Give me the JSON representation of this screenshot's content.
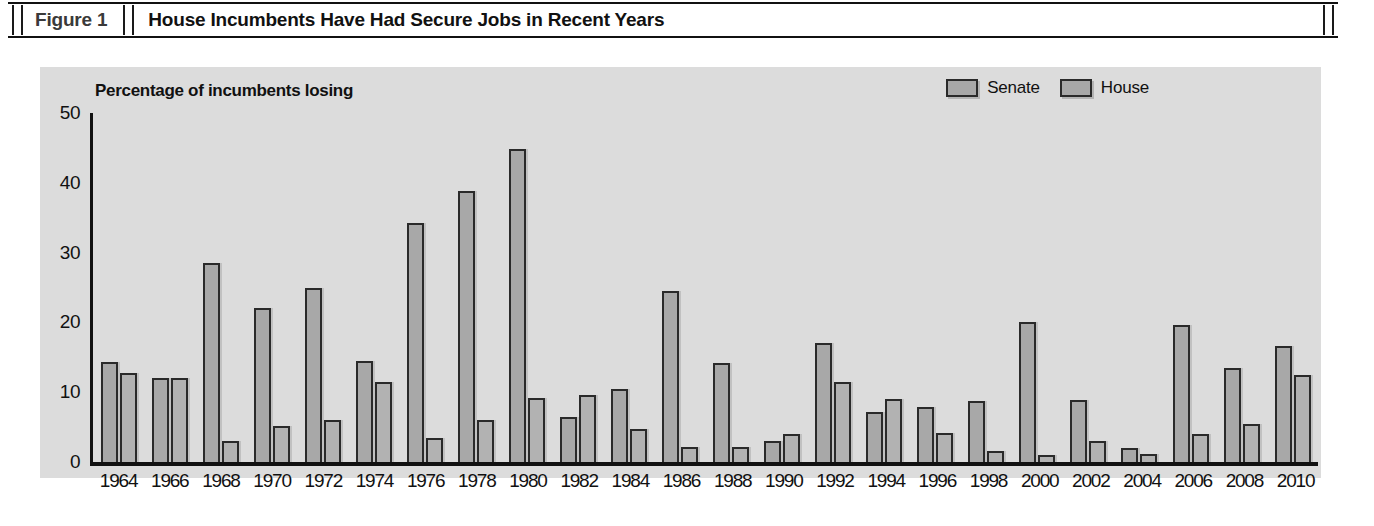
{
  "figure": {
    "number": "Figure 1",
    "title": "House Incumbents Have Had Secure Jobs in Recent Years"
  },
  "colors": {
    "panel_background": "#dcdcdc",
    "bar_fill": "#a8a8a8",
    "bar_outline": "#2a2a2a",
    "axis": "#111111",
    "page_background": "#ffffff"
  },
  "chart_data": {
    "type": "bar",
    "title": "Percentage of incumbents losing",
    "xlabel": "",
    "ylabel": "",
    "ylim": [
      0,
      50
    ],
    "yticks": [
      "0",
      "10",
      "20",
      "30",
      "40",
      "50"
    ],
    "grid": false,
    "legend_position": "top-right",
    "categories": [
      "1964",
      "1966",
      "1968",
      "1970",
      "1972",
      "1974",
      "1976",
      "1978",
      "1980",
      "1982",
      "1984",
      "1986",
      "1988",
      "1990",
      "1992",
      "1994",
      "1996",
      "1998",
      "2000",
      "2002",
      "2004",
      "2006",
      "2008",
      "2010"
    ],
    "series": [
      {
        "name": "Senate",
        "values": [
          14.3,
          12.0,
          28.5,
          22.0,
          25.0,
          14.5,
          34.2,
          38.8,
          44.8,
          6.5,
          10.4,
          24.5,
          14.2,
          3.0,
          17.0,
          7.2,
          7.9,
          8.8,
          20.0,
          8.9,
          2.0,
          19.6,
          13.4,
          16.6
        ]
      },
      {
        "name": "House",
        "values": [
          12.7,
          12.0,
          3.0,
          5.1,
          6.0,
          11.5,
          3.5,
          6.0,
          9.2,
          9.6,
          4.8,
          2.1,
          2.2,
          4.0,
          11.4,
          9.0,
          4.1,
          1.6,
          1.0,
          3.0,
          1.2,
          4.0,
          5.5,
          12.5
        ]
      }
    ]
  }
}
